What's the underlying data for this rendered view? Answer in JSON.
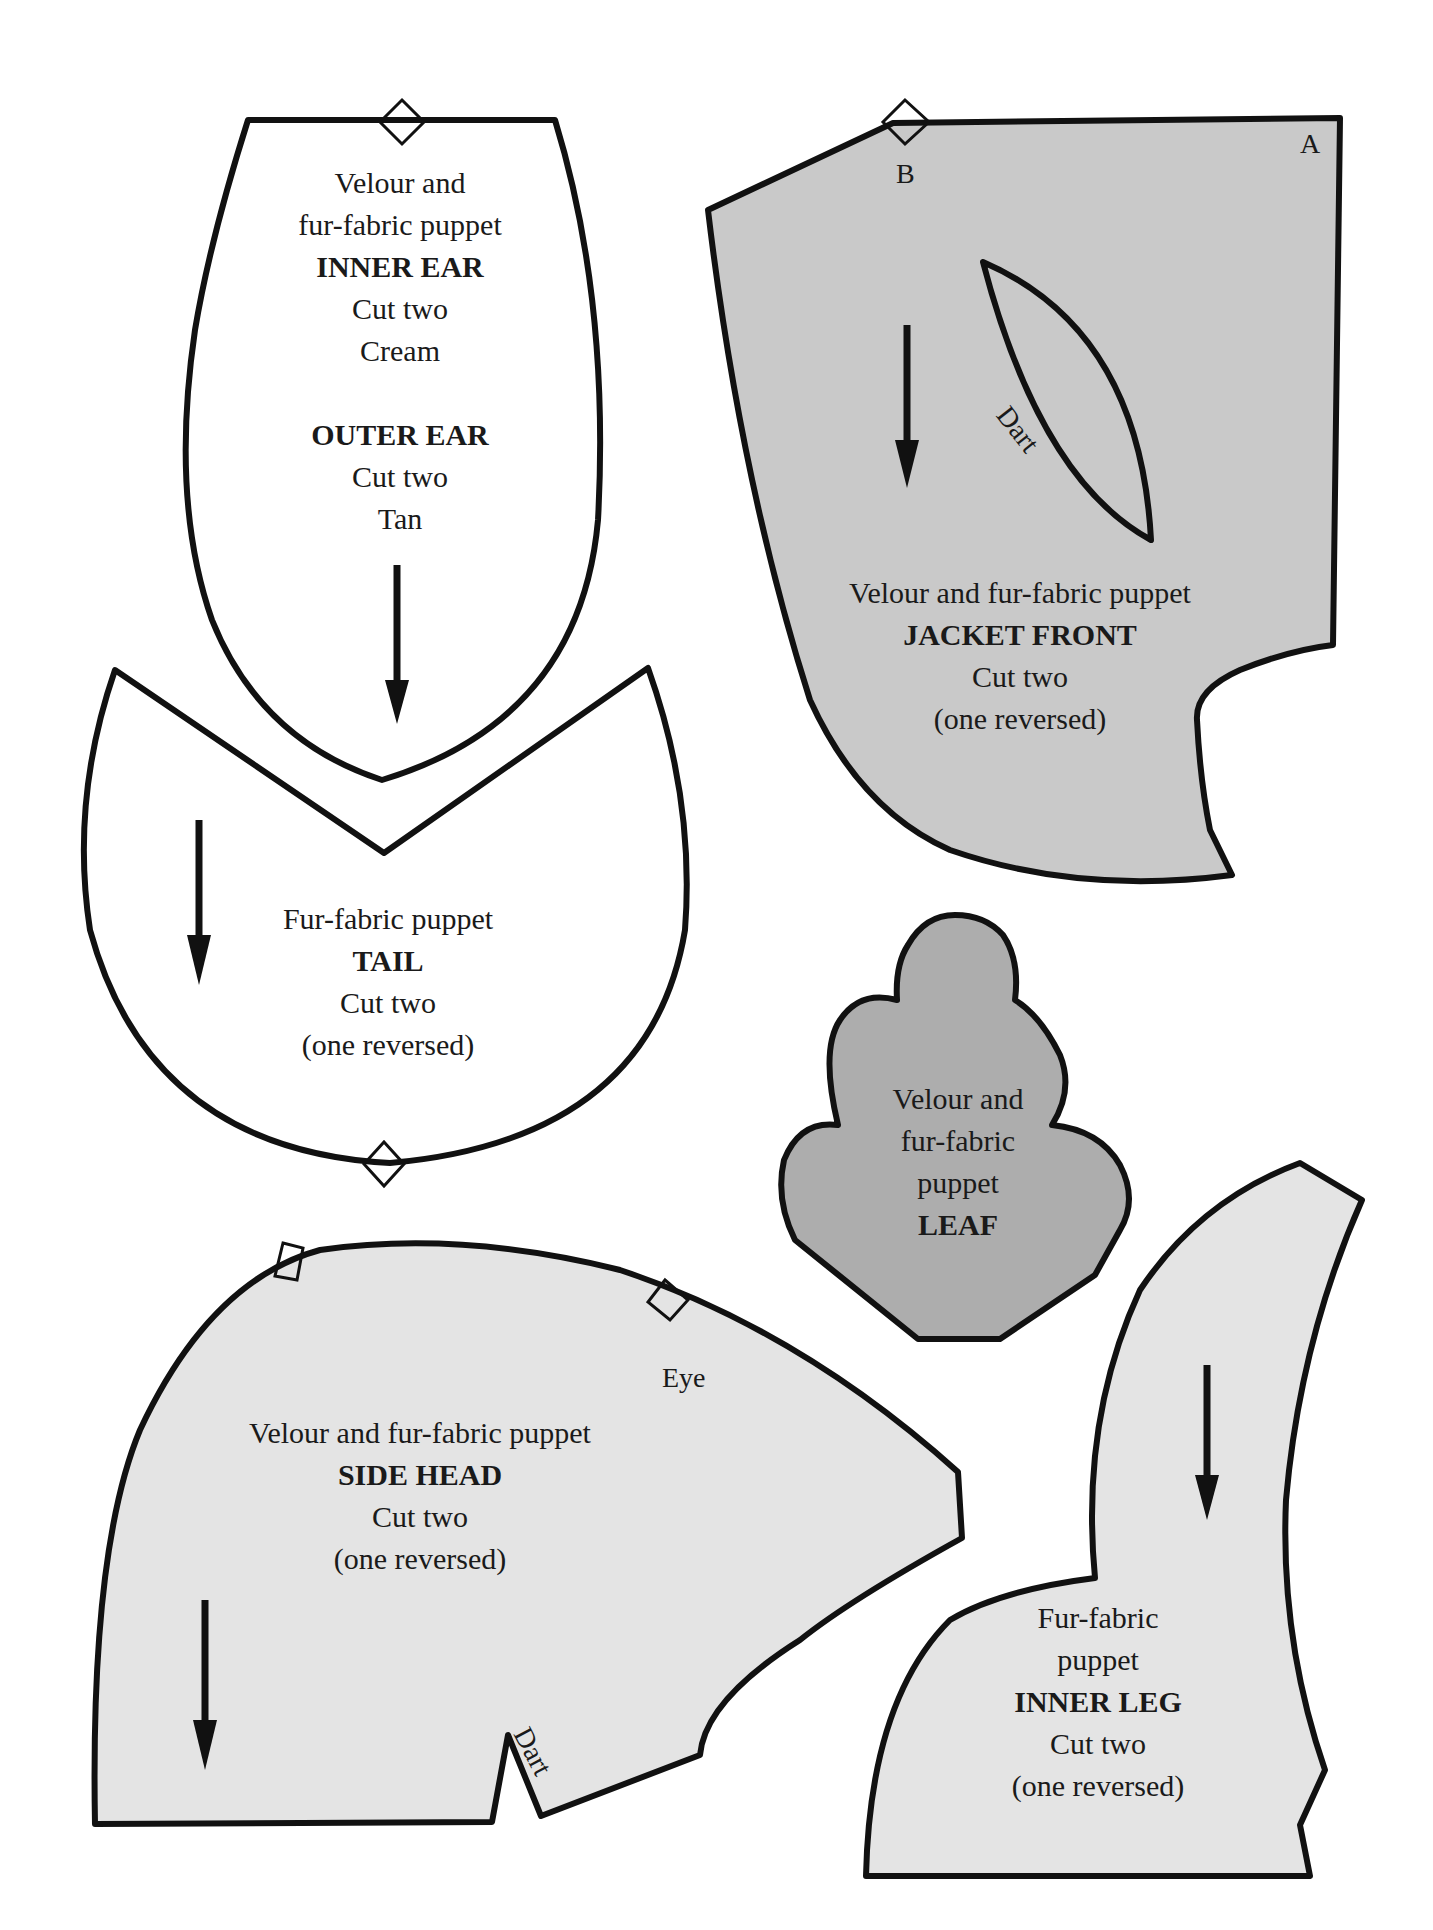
{
  "pieces": {
    "ear": {
      "line1": "Velour and",
      "line2": "fur-fabric puppet",
      "inner_title": "INNER EAR",
      "inner_cut": "Cut two",
      "inner_color": "Cream",
      "outer_title": "OUTER EAR",
      "outer_cut": "Cut two",
      "outer_color": "Tan"
    },
    "jacket_front": {
      "line1": "Velour and fur-fabric puppet",
      "title": "JACKET FRONT",
      "cut": "Cut two",
      "note": "(one reversed)",
      "marker_a": "A",
      "marker_b": "B",
      "dart_label": "Dart",
      "fill": "#c9c9c9"
    },
    "tail": {
      "line1": "Fur-fabric puppet",
      "title": "TAIL",
      "cut": "Cut two",
      "note": "(one reversed)"
    },
    "leaf": {
      "line1": "Velour and",
      "line2": "fur-fabric",
      "line3": "puppet",
      "title": "LEAF",
      "fill": "#adadad"
    },
    "side_head": {
      "line1": "Velour and fur-fabric puppet",
      "title": "SIDE HEAD",
      "cut": "Cut two",
      "note": "(one reversed)",
      "eye_label": "Eye",
      "dart_label": "Dart",
      "fill": "#e4e4e4"
    },
    "inner_leg": {
      "line1": "Fur-fabric",
      "line2": "puppet",
      "title": "INNER LEG",
      "cut": "Cut two",
      "note": "(one reversed)",
      "fill": "#e4e4e4"
    }
  },
  "colors": {
    "outline": "#111111",
    "background": "#ffffff"
  }
}
